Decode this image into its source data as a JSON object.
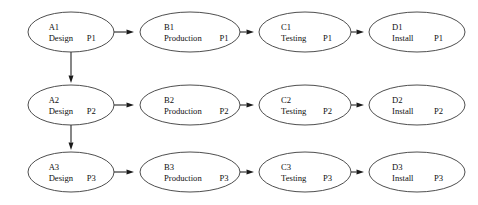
{
  "diagram": {
    "type": "node-link-diagram",
    "background_color": "#ffffff",
    "node_fill_color": "#ffffff",
    "node_stroke_color": "#3a3a3a",
    "edge_color": "#1a1a1a",
    "text_color": "#101010",
    "rows": 3,
    "columns": 4,
    "nodes": [
      {
        "id": "A1",
        "task": "Design",
        "phase": "P1",
        "cx": 71,
        "cy": 32,
        "rx": 43,
        "ry": 20
      },
      {
        "id": "B1",
        "task": "Production",
        "phase": "P1",
        "cx": 190,
        "cy": 32,
        "rx": 50,
        "ry": 20
      },
      {
        "id": "C1",
        "task": "Testing",
        "phase": "P1",
        "cx": 305,
        "cy": 32,
        "rx": 46,
        "ry": 20
      },
      {
        "id": "D1",
        "task": "Install",
        "phase": "P1",
        "cx": 417,
        "cy": 32,
        "rx": 48,
        "ry": 20
      },
      {
        "id": "A2",
        "task": "Design",
        "phase": "P2",
        "cx": 71,
        "cy": 105,
        "rx": 43,
        "ry": 20
      },
      {
        "id": "B2",
        "task": "Production",
        "phase": "P2",
        "cx": 190,
        "cy": 105,
        "rx": 50,
        "ry": 20
      },
      {
        "id": "C2",
        "task": "Testing",
        "phase": "P2",
        "cx": 305,
        "cy": 105,
        "rx": 46,
        "ry": 20
      },
      {
        "id": "D2",
        "task": "Install",
        "phase": "P2",
        "cx": 417,
        "cy": 105,
        "rx": 48,
        "ry": 20
      },
      {
        "id": "A3",
        "task": "Design",
        "phase": "P3",
        "cx": 71,
        "cy": 172,
        "rx": 43,
        "ry": 20
      },
      {
        "id": "B3",
        "task": "Production",
        "phase": "P3",
        "cx": 190,
        "cy": 172,
        "rx": 50,
        "ry": 20
      },
      {
        "id": "C3",
        "task": "Testing",
        "phase": "P3",
        "cx": 305,
        "cy": 172,
        "rx": 46,
        "ry": 20
      },
      {
        "id": "D3",
        "task": "Install",
        "phase": "P3",
        "cx": 417,
        "cy": 172,
        "rx": 48,
        "ry": 20
      }
    ],
    "edges": [
      {
        "from": "A1",
        "to": "B1",
        "orientation": "horizontal",
        "x1": 114,
        "y1": 32,
        "x2": 134,
        "y2": 32
      },
      {
        "from": "B1",
        "to": "C1",
        "orientation": "horizontal",
        "x1": 240,
        "y1": 32,
        "x2": 254,
        "y2": 32
      },
      {
        "from": "C1",
        "to": "D1",
        "orientation": "horizontal",
        "x1": 351,
        "y1": 32,
        "x2": 364,
        "y2": 32
      },
      {
        "from": "A2",
        "to": "B2",
        "orientation": "horizontal",
        "x1": 114,
        "y1": 105,
        "x2": 134,
        "y2": 105
      },
      {
        "from": "B2",
        "to": "C2",
        "orientation": "horizontal",
        "x1": 240,
        "y1": 105,
        "x2": 254,
        "y2": 105
      },
      {
        "from": "C2",
        "to": "D2",
        "orientation": "horizontal",
        "x1": 351,
        "y1": 105,
        "x2": 364,
        "y2": 105
      },
      {
        "from": "A3",
        "to": "B3",
        "orientation": "horizontal",
        "x1": 114,
        "y1": 172,
        "x2": 134,
        "y2": 172
      },
      {
        "from": "B3",
        "to": "C3",
        "orientation": "horizontal",
        "x1": 240,
        "y1": 172,
        "x2": 254,
        "y2": 172
      },
      {
        "from": "C3",
        "to": "D3",
        "orientation": "horizontal",
        "x1": 351,
        "y1": 172,
        "x2": 364,
        "y2": 172
      },
      {
        "from": "A1",
        "to": "A2",
        "orientation": "vertical",
        "x1": 71,
        "y1": 52,
        "x2": 71,
        "y2": 83
      },
      {
        "from": "A2",
        "to": "A3",
        "orientation": "vertical",
        "x1": 71,
        "y1": 125,
        "x2": 71,
        "y2": 150
      }
    ]
  }
}
